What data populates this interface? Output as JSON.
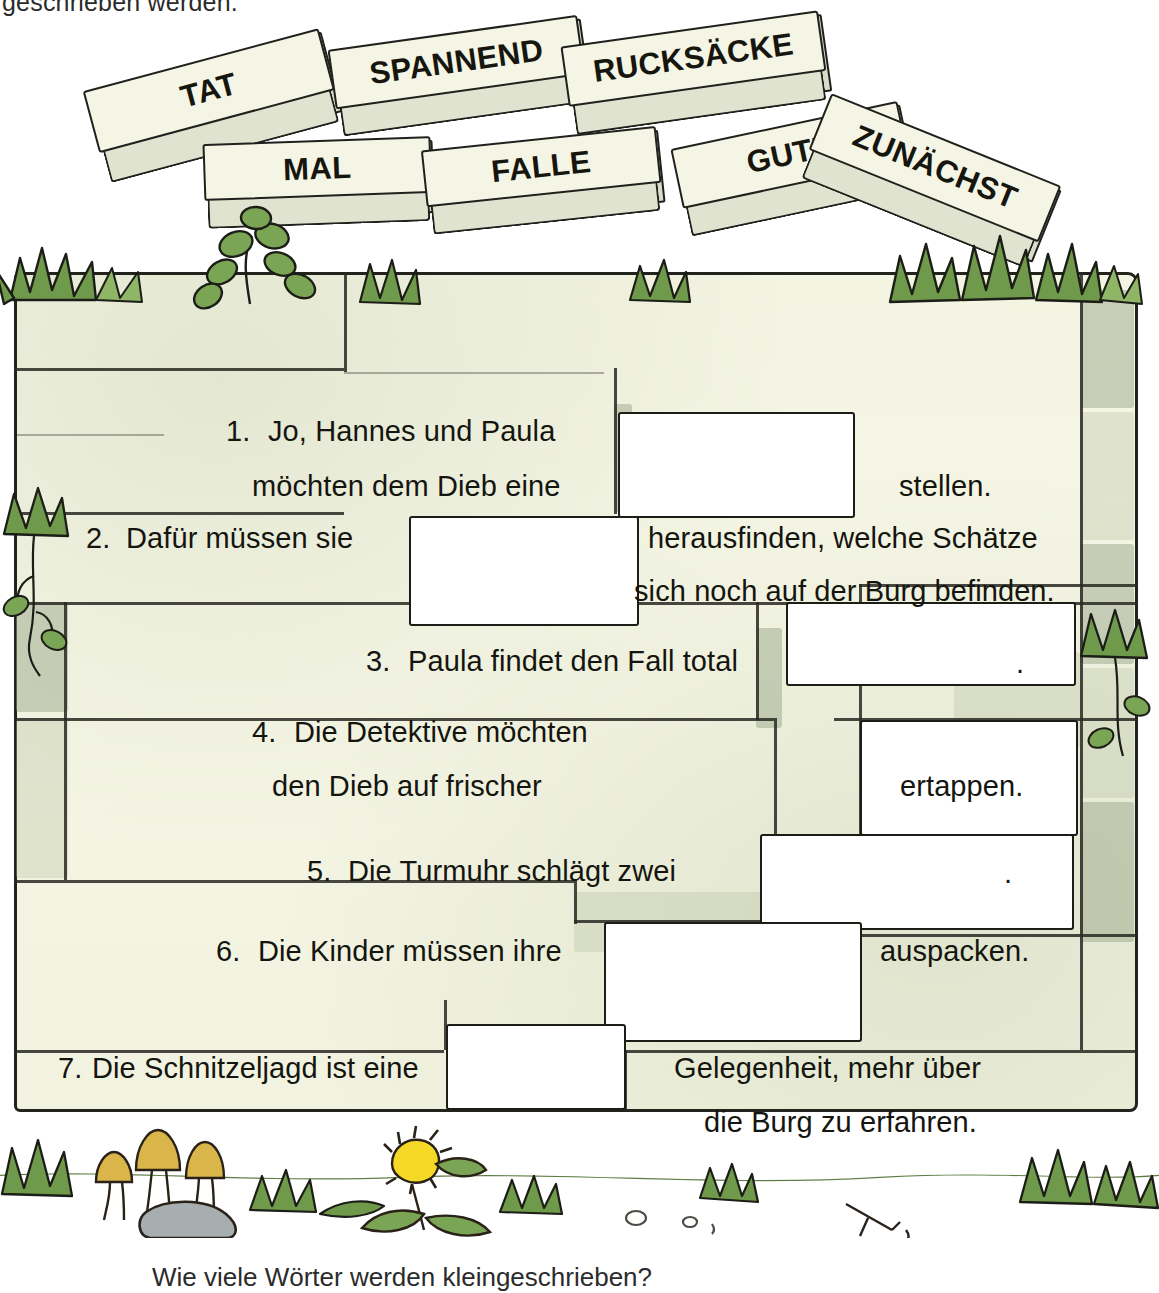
{
  "page": {
    "top_instruction": "geschrieben werden.",
    "bottom_question": "Wie viele Wörter werden kleingeschrieben?"
  },
  "word_blocks": [
    {
      "id": "block-tat",
      "word": "TAT"
    },
    {
      "id": "block-spannend",
      "word": "SPANNEND"
    },
    {
      "id": "block-rucksaecke",
      "word": "RUCKSÄCKE"
    },
    {
      "id": "block-mal",
      "word": "MAL"
    },
    {
      "id": "block-falle",
      "word": "FALLE"
    },
    {
      "id": "block-gute",
      "word": "GUTE"
    },
    {
      "id": "block-zunaechst",
      "word": "ZUNÄCHST"
    }
  ],
  "sentences": [
    {
      "number": "1.",
      "line1": "Jo, Hannes und Paula",
      "line2_before": "möchten dem Dieb eine",
      "line2_after": "stellen."
    },
    {
      "number": "2.",
      "line1_before": "Dafür müssen sie",
      "line1_after": "herausfinden, welche Schätze",
      "line2": "sich noch auf der Burg befinden."
    },
    {
      "number": "3.",
      "line1_before": "Paula findet den Fall total",
      "line1_after": "."
    },
    {
      "number": "4.",
      "line1": "Die Detektive möchten",
      "line2_before": "den Dieb auf frischer",
      "line2_after": "ertappen."
    },
    {
      "number": "5.",
      "line1_before": "Die Turmuhr schlägt zwei",
      "line1_after": "."
    },
    {
      "number": "6.",
      "line1_before": "Die Kinder müssen ihre",
      "line1_after": "auspacken."
    },
    {
      "number": "7.",
      "line1_before": "Die Schnitzeljagd ist eine",
      "line1_after": "Gelegenheit, mehr über",
      "line2": "die Burg zu erfahren."
    }
  ],
  "colors": {
    "wall_fill": "#f4f5e3",
    "stone_shade": "#97a385",
    "ink": "#20201c",
    "leaf_green": "#6f9a4b",
    "leaf_green_dark": "#4e7a33",
    "mushroom": "#d9b54a",
    "rock_gray": "#a7aeb0",
    "dandelion_yellow": "#f5d926"
  }
}
